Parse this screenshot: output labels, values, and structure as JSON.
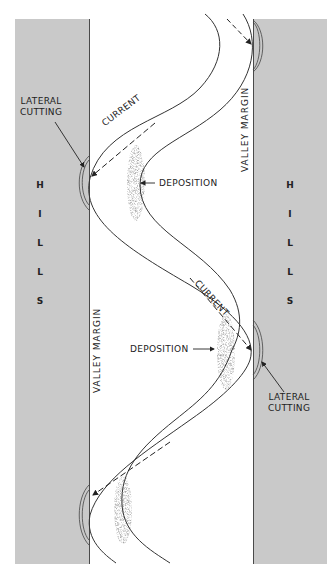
{
  "diagram": {
    "type": "meandering-river-cross-section-plan",
    "colors": {
      "hills": "#c9c9c9",
      "lines": "#333333",
      "background": "#ffffff"
    },
    "hills_left": {
      "label": "HILLS",
      "letters": [
        "H",
        "I",
        "L",
        "L",
        "S"
      ]
    },
    "hills_right": {
      "label": "HILLS",
      "letters": [
        "H",
        "I",
        "L",
        "L",
        "S"
      ]
    },
    "labels": {
      "lateral_cutting_top": [
        "LATERAL",
        "CUTTING"
      ],
      "lateral_cutting_bottom": [
        "LATERAL",
        "CUTTING"
      ],
      "current_top": "CURRENT",
      "current_bottom": "CURRENT",
      "deposition_top": "DEPOSITION",
      "deposition_bottom": "DEPOSITION",
      "valley_margin_left": "VALLEY MARGIN",
      "valley_margin_right": "VALLEY MARGIN"
    }
  }
}
